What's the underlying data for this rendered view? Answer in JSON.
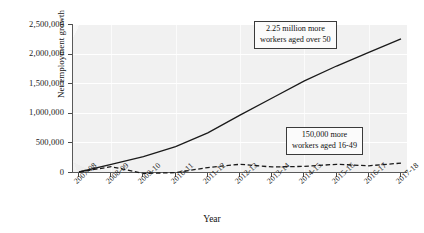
{
  "chart_data": {
    "type": "line",
    "title": "",
    "xlabel": "Year",
    "ylabel": "Net employment growth",
    "categories": [
      "2007-08",
      "2008-09",
      "2009-10",
      "2010-11",
      "2011-12",
      "2012-13",
      "2013-14",
      "2014-15",
      "2015-16",
      "2016-17",
      "2017-18"
    ],
    "ylim": [
      0,
      2500000
    ],
    "ytick_labels": [
      "0",
      "500,000",
      "1,000,000",
      "1,500,000",
      "2,000,000",
      "2,500,000"
    ],
    "ytick_values": [
      0,
      500000,
      1000000,
      1500000,
      2000000,
      2500000
    ],
    "grid": true,
    "legend_position": "none",
    "series": [
      {
        "name": "Workers aged over 50",
        "style": "solid",
        "color": "#1a1a1a",
        "values": [
          0,
          130000,
          260000,
          430000,
          660000,
          960000,
          1250000,
          1540000,
          1790000,
          2020000,
          2250000
        ]
      },
      {
        "name": "Workers aged 16-49",
        "style": "dashed",
        "color": "#1a1a1a",
        "values": [
          0,
          90000,
          -25000,
          -10000,
          75000,
          130000,
          85000,
          95000,
          130000,
          105000,
          150000
        ]
      }
    ],
    "annotations": [
      {
        "id": "over50",
        "line1": "2.25 million more",
        "line2": "workers aged over 50"
      },
      {
        "id": "under50",
        "line1": "150,000 more",
        "line2": "workers aged 16-49"
      }
    ]
  }
}
